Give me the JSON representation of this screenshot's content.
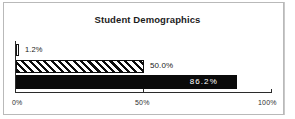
{
  "chart_data": {
    "type": "bar",
    "orientation": "horizontal",
    "title": "Student Demographics",
    "xlabel": "",
    "ylabel": "",
    "xlim": [
      0,
      100
    ],
    "grid": false,
    "legend": false,
    "categories": [
      "series-1",
      "series-2",
      "series-3"
    ],
    "values": [
      1.2,
      50.0,
      86.2
    ],
    "data_labels": [
      "1.2%",
      "50.0%",
      "86.2%"
    ],
    "bar_styles": [
      "hollow-outline",
      "diagonal-hatch",
      "solid-black"
    ],
    "xticks": [
      0,
      50,
      100
    ],
    "xtick_labels": [
      "0%",
      "50%",
      "100%"
    ]
  },
  "axis": {
    "ticks": [
      {
        "label": "0%",
        "value": 0
      },
      {
        "label": "50%",
        "value": 50
      },
      {
        "label": "100%",
        "value": 100
      }
    ]
  },
  "colors": {
    "bar_fill_solid": "#0a0a0a",
    "bar_outline": "#151515",
    "axis": "#2b2b2b",
    "text": "#1c1c1c",
    "label_on_dark": "#ffffff",
    "frame": "#b9b9b9",
    "background": "#ffffff"
  }
}
